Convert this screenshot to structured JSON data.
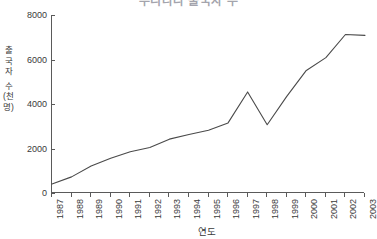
{
  "chart_data": {
    "type": "line",
    "title": "우리나라 출국자 수",
    "xlabel": "연도",
    "ylabel": "출국자 수(천 명)",
    "ylabel_chars": [
      "출",
      "국",
      "자",
      "수",
      "(천",
      "명)"
    ],
    "categories": [
      "1987",
      "1988",
      "1989",
      "1990",
      "1991",
      "1992",
      "1993",
      "1994",
      "1995",
      "1996",
      "1997",
      "1998",
      "1999",
      "2000",
      "2001",
      "2002",
      "2003"
    ],
    "values": [
      405,
      725,
      1213,
      1560,
      1856,
      2043,
      2420,
      2628,
      2820,
      3150,
      4542,
      3067,
      4342,
      5508,
      6084,
      7123,
      7086
    ],
    "ylim": [
      0,
      8000
    ],
    "yticks": [
      0,
      2000,
      4000,
      6000,
      8000
    ],
    "ytick_labels": [
      "0",
      "2000",
      "4000",
      "6000",
      "8000"
    ],
    "grid": false,
    "legend": "none",
    "line_color": "#4a4a4a",
    "axis_color": "#5a5a5a",
    "background": "#ffffff"
  }
}
